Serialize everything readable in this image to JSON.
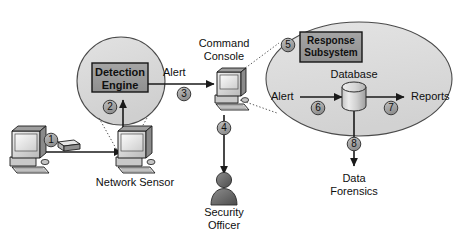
{
  "diagram": {
    "colors": {
      "circle_fill": "#d4d4d4",
      "circle_stroke": "#4a4a4a",
      "box_fill": "#9a9a9a",
      "box_stroke": "#141414",
      "ellipse_fill": "#d9d9d9",
      "ellipse_stroke": "#4a4a4a",
      "badge_fill": "#a8a8a8",
      "badge_stroke": "#3a3a3a",
      "line": "#1a1a1a",
      "text": "#0f0f0f",
      "device_light": "#e3e3e3",
      "device_mid": "#b4b4b4",
      "device_dark": "#6e6e6e",
      "device_outline": "#1c1c1c"
    },
    "nodes": {
      "detection_engine": {
        "label_line1": "Detection",
        "label_line2": "Engine"
      },
      "response_subsystem": {
        "label_line1": "Response",
        "label_line2": "Subsystem"
      },
      "network_sensor": {
        "label": "Network Sensor"
      },
      "command_console": {
        "label_line1": "Command",
        "label_line2": "Console"
      },
      "security_officer": {
        "label_line1": "Security",
        "label_line2": "Officer"
      },
      "database": {
        "label": "Database"
      },
      "data_forensics": {
        "label_line1": "Data",
        "label_line2": "Forensics"
      },
      "workstation": {
        "label": ""
      },
      "packet": {
        "label": ""
      }
    },
    "edge_labels": {
      "alert_sensor_to_console": "Alert",
      "alert_into_database": "Alert",
      "reports": "Reports"
    },
    "step_badges": [
      {
        "id": "1",
        "label": "1"
      },
      {
        "id": "2",
        "label": "2"
      },
      {
        "id": "3",
        "label": "3"
      },
      {
        "id": "4",
        "label": "4"
      },
      {
        "id": "5",
        "label": "5"
      },
      {
        "id": "6",
        "label": "6"
      },
      {
        "id": "7",
        "label": "7"
      },
      {
        "id": "8",
        "label": "8"
      }
    ]
  }
}
